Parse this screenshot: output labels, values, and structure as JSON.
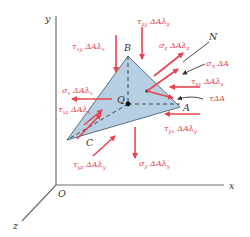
{
  "diagram": {
    "colors": {
      "force_arrow": "#e8434f",
      "face_fill": "#b7cfe2",
      "face_edge": "#5a6e80",
      "axis": "#6e6e6e",
      "label_dark": "#333333"
    },
    "axes": {
      "x_label": "x",
      "y_label": "y",
      "z_label": "z",
      "origin_label": "O"
    },
    "vertices": {
      "A": "A",
      "B": "B",
      "C": "C",
      "Q": "Q"
    },
    "normal_label": "N",
    "forces": [
      {
        "id": "tau_zy",
        "label": "τzy ΔAλz",
        "sym": "τ",
        "sub": "zy",
        "rest": " ΔAλ",
        "sub2": "z"
      },
      {
        "id": "sigma_z",
        "label": "σz ΔAλz",
        "sym": "σ",
        "sub": "z",
        "rest": " ΔAλ",
        "sub2": "z"
      },
      {
        "id": "tau_xy",
        "label": "τxy ΔAλx",
        "sym": "τ",
        "sub": "xy",
        "rest": " ΔAλ",
        "sub2": "x"
      },
      {
        "id": "sigma_n",
        "label": "σn ΔA",
        "sym": "σ",
        "sub": "n",
        "rest": " ΔA",
        "sub2": ""
      },
      {
        "id": "tau_zx",
        "label": "τzx ΔAλz",
        "sym": "τ",
        "sub": "zx",
        "rest": " ΔAλ",
        "sub2": "z"
      },
      {
        "id": "sigma_x",
        "label": "σx ΔAλx",
        "sym": "σ",
        "sub": "x",
        "rest": " ΔAλ",
        "sub2": "x"
      },
      {
        "id": "tau_A",
        "label": "τΔA",
        "sym": "τ",
        "sub": "",
        "rest": "ΔA",
        "sub2": ""
      },
      {
        "id": "tau_xz",
        "label": "τxz ΔAλx",
        "sym": "τ",
        "sub": "xz",
        "rest": " ΔAλ",
        "sub2": "x"
      },
      {
        "id": "tau_yx",
        "label": "τyx ΔAλy",
        "sym": "τ",
        "sub": "yx",
        "rest": " ΔAλ",
        "sub2": "y"
      },
      {
        "id": "tau_yz",
        "label": "τyz ΔAλy",
        "sym": "τ",
        "sub": "yz",
        "rest": " ΔAλ",
        "sub2": "y"
      },
      {
        "id": "sigma_y",
        "label": "σy ΔAλy",
        "sym": "σ",
        "sub": "y",
        "rest": " ΔAλ",
        "sub2": "y"
      }
    ]
  }
}
